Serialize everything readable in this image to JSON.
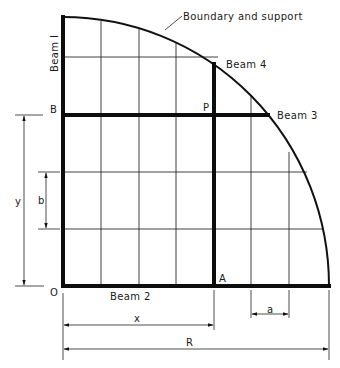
{
  "diagram": {
    "title_annotation": "Boundary and support",
    "labels": {
      "beam1": "Beam I",
      "beam2": "Beam 2",
      "beam3": "Beam 3",
      "beam4": "Beam 4",
      "point_b": "B",
      "point_p": "P",
      "point_a": "A",
      "origin": "O"
    },
    "dimensions": {
      "x": "x",
      "y": "y",
      "a": "a",
      "b": "b",
      "R": "R"
    },
    "colors": {
      "line": "#111111",
      "background": "#ffffff"
    }
  }
}
